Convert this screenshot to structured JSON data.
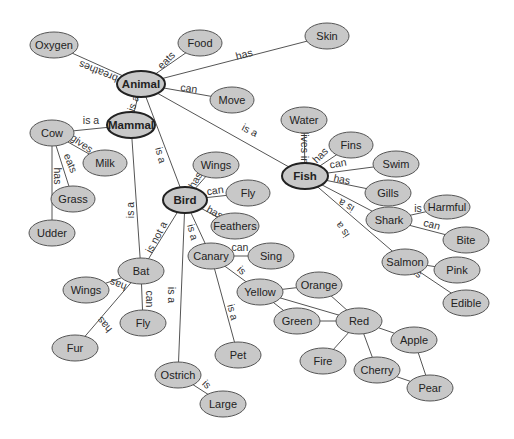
{
  "diagram": {
    "type": "concept-map",
    "colors": {
      "node_fill": "#c8c8c8",
      "node_stroke": "#555555",
      "primary_stroke": "#222222",
      "edge": "#555555",
      "text": "#222222"
    },
    "nodes": [
      {
        "id": "oxygen",
        "label": "Oxygen",
        "x": 54,
        "y": 45,
        "rx": 24,
        "ry": 13
      },
      {
        "id": "food",
        "label": "Food",
        "x": 200,
        "y": 43,
        "rx": 22,
        "ry": 13
      },
      {
        "id": "skin",
        "label": "Skin",
        "x": 327,
        "y": 36,
        "rx": 22,
        "ry": 13
      },
      {
        "id": "animal",
        "label": "Animal",
        "x": 141,
        "y": 84,
        "rx": 24,
        "ry": 13,
        "primary": true
      },
      {
        "id": "move",
        "label": "Move",
        "x": 232,
        "y": 100,
        "rx": 22,
        "ry": 13
      },
      {
        "id": "mammal",
        "label": "Mammal",
        "x": 131,
        "y": 125,
        "rx": 24,
        "ry": 13,
        "primary": true
      },
      {
        "id": "cow",
        "label": "Cow",
        "x": 52,
        "y": 133,
        "rx": 22,
        "ry": 13
      },
      {
        "id": "milk",
        "label": "Milk",
        "x": 105,
        "y": 163,
        "rx": 22,
        "ry": 13
      },
      {
        "id": "grass",
        "label": "Grass",
        "x": 73,
        "y": 199,
        "rx": 22,
        "ry": 13
      },
      {
        "id": "udder",
        "label": "Udder",
        "x": 52,
        "y": 233,
        "rx": 23,
        "ry": 13
      },
      {
        "id": "water",
        "label": "Water",
        "x": 304,
        "y": 120,
        "rx": 23,
        "ry": 13
      },
      {
        "id": "fins",
        "label": "Fins",
        "x": 351,
        "y": 145,
        "rx": 22,
        "ry": 13
      },
      {
        "id": "swim",
        "label": "Swim",
        "x": 396,
        "y": 164,
        "rx": 23,
        "ry": 13
      },
      {
        "id": "fish",
        "label": "Fish",
        "x": 305,
        "y": 176,
        "rx": 23,
        "ry": 13,
        "primary": true
      },
      {
        "id": "gills",
        "label": "Gills",
        "x": 388,
        "y": 193,
        "rx": 23,
        "ry": 13
      },
      {
        "id": "wings_bird",
        "label": "Wings",
        "x": 216,
        "y": 165,
        "rx": 23,
        "ry": 13
      },
      {
        "id": "fly_bird",
        "label": "Fly",
        "x": 248,
        "y": 193,
        "rx": 22,
        "ry": 13
      },
      {
        "id": "bird",
        "label": "Bird",
        "x": 185,
        "y": 200,
        "rx": 22,
        "ry": 13,
        "primary": true
      },
      {
        "id": "feathers",
        "label": "Feathers",
        "x": 235,
        "y": 226,
        "rx": 24,
        "ry": 13
      },
      {
        "id": "harmful",
        "label": "Harmful",
        "x": 447,
        "y": 207,
        "rx": 23,
        "ry": 12
      },
      {
        "id": "shark",
        "label": "Shark",
        "x": 389,
        "y": 220,
        "rx": 23,
        "ry": 13
      },
      {
        "id": "bite",
        "label": "Bite",
        "x": 466,
        "y": 240,
        "rx": 23,
        "ry": 13
      },
      {
        "id": "canary",
        "label": "Canary",
        "x": 211,
        "y": 256,
        "rx": 23,
        "ry": 13
      },
      {
        "id": "sing",
        "label": "Sing",
        "x": 271,
        "y": 256,
        "rx": 23,
        "ry": 13
      },
      {
        "id": "salmon",
        "label": "Salmon",
        "x": 405,
        "y": 262,
        "rx": 23,
        "ry": 13
      },
      {
        "id": "pink",
        "label": "Pink",
        "x": 457,
        "y": 270,
        "rx": 23,
        "ry": 13
      },
      {
        "id": "bat",
        "label": "Bat",
        "x": 141,
        "y": 271,
        "rx": 23,
        "ry": 13
      },
      {
        "id": "wings_bat",
        "label": "Wings",
        "x": 86,
        "y": 290,
        "rx": 23,
        "ry": 13
      },
      {
        "id": "yellow",
        "label": "Yellow",
        "x": 260,
        "y": 292,
        "rx": 23,
        "ry": 13
      },
      {
        "id": "orange",
        "label": "Orange",
        "x": 319,
        "y": 285,
        "rx": 23,
        "ry": 13
      },
      {
        "id": "edible",
        "label": "Edible",
        "x": 466,
        "y": 303,
        "rx": 23,
        "ry": 13
      },
      {
        "id": "fly_bat",
        "label": "Fly",
        "x": 143,
        "y": 323,
        "rx": 23,
        "ry": 13
      },
      {
        "id": "green",
        "label": "Green",
        "x": 297,
        "y": 321,
        "rx": 23,
        "ry": 13
      },
      {
        "id": "red",
        "label": "Red",
        "x": 359,
        "y": 321,
        "rx": 23,
        "ry": 13
      },
      {
        "id": "apple",
        "label": "Apple",
        "x": 414,
        "y": 340,
        "rx": 23,
        "ry": 13
      },
      {
        "id": "fur",
        "label": "Fur",
        "x": 75,
        "y": 348,
        "rx": 23,
        "ry": 13
      },
      {
        "id": "pet",
        "label": "Pet",
        "x": 238,
        "y": 355,
        "rx": 23,
        "ry": 13
      },
      {
        "id": "fire",
        "label": "Fire",
        "x": 323,
        "y": 361,
        "rx": 23,
        "ry": 13
      },
      {
        "id": "cherry",
        "label": "Cherry",
        "x": 377,
        "y": 370,
        "rx": 23,
        "ry": 13
      },
      {
        "id": "ostrich",
        "label": "Ostrich",
        "x": 178,
        "y": 375,
        "rx": 23,
        "ry": 13
      },
      {
        "id": "pear",
        "label": "Pear",
        "x": 430,
        "y": 388,
        "rx": 23,
        "ry": 13
      },
      {
        "id": "large",
        "label": "Large",
        "x": 223,
        "y": 404,
        "rx": 23,
        "ry": 13
      }
    ],
    "edges": [
      {
        "from": "animal",
        "to": "oxygen",
        "label": "breathes",
        "lx": 98,
        "ly": 72,
        "angle": 202
      },
      {
        "from": "animal",
        "to": "food",
        "label": "eats",
        "lx": 166,
        "ly": 60,
        "angle": -45
      },
      {
        "from": "animal",
        "to": "skin",
        "label": "has",
        "lx": 244,
        "ly": 54,
        "angle": -15
      },
      {
        "from": "animal",
        "to": "move",
        "label": "can",
        "lx": 189,
        "ly": 88,
        "angle": 8
      },
      {
        "from": "mammal",
        "to": "animal",
        "label": "is a",
        "lx": 133,
        "ly": 103,
        "angle": -70
      },
      {
        "from": "animal",
        "to": "bird",
        "label": "is a",
        "lx": 161,
        "ly": 155,
        "angle": 75
      },
      {
        "from": "animal",
        "to": "fish",
        "label": "is a",
        "lx": 250,
        "ly": 130,
        "angle": 27
      },
      {
        "from": "cow",
        "to": "mammal",
        "label": "is a",
        "lx": 91,
        "ly": 120,
        "angle": 0
      },
      {
        "from": "cow",
        "to": "milk",
        "label": "gives",
        "lx": 82,
        "ly": 143,
        "angle": 35
      },
      {
        "from": "cow",
        "to": "grass",
        "label": "eats",
        "lx": 71,
        "ly": 163,
        "angle": 68
      },
      {
        "from": "cow",
        "to": "udder",
        "label": "has",
        "lx": 58,
        "ly": 176,
        "angle": 90
      },
      {
        "from": "bat",
        "to": "mammal",
        "label": "is a",
        "lx": 130,
        "ly": 210,
        "angle": -90
      },
      {
        "from": "bird",
        "to": "wings_bird",
        "label": "has",
        "lx": 195,
        "ly": 180,
        "angle": -60
      },
      {
        "from": "bird",
        "to": "fly_bird",
        "label": "can",
        "lx": 215,
        "ly": 190,
        "angle": -8
      },
      {
        "from": "bird",
        "to": "feathers",
        "label": "has",
        "lx": 215,
        "ly": 212,
        "angle": 28
      },
      {
        "from": "bat",
        "to": "bird",
        "label": "is not a",
        "lx": 156,
        "ly": 237,
        "angle": -62
      },
      {
        "from": "canary",
        "to": "bird",
        "label": "is a",
        "lx": 193,
        "ly": 232,
        "angle": 75
      },
      {
        "from": "ostrich",
        "to": "bird",
        "label": "is a",
        "lx": 172,
        "ly": 295,
        "angle": 90
      },
      {
        "from": "fish",
        "to": "water",
        "label": "lives in",
        "lx": 305,
        "ly": 148,
        "angle": 90
      },
      {
        "from": "fish",
        "to": "fins",
        "label": "has",
        "lx": 320,
        "ly": 155,
        "angle": -45
      },
      {
        "from": "fish",
        "to": "swim",
        "label": "can",
        "lx": 338,
        "ly": 163,
        "angle": -10
      },
      {
        "from": "fish",
        "to": "gills",
        "label": "has",
        "lx": 342,
        "ly": 179,
        "angle": 12
      },
      {
        "from": "shark",
        "to": "fish",
        "label": "is a",
        "lx": 346,
        "ly": 206,
        "angle": 210
      },
      {
        "from": "salmon",
        "to": "fish",
        "label": "is a",
        "lx": 342,
        "ly": 230,
        "angle": 235
      },
      {
        "from": "shark",
        "to": "harmful",
        "label": "is",
        "lx": 418,
        "ly": 208,
        "angle": 0
      },
      {
        "from": "shark",
        "to": "bite",
        "label": "can",
        "lx": 432,
        "ly": 224,
        "angle": 15
      },
      {
        "from": "salmon",
        "to": "pink",
        "label": "is",
        "lx": 416,
        "ly": 259,
        "angle": 0
      },
      {
        "from": "salmon",
        "to": "edible",
        "label": "is",
        "lx": 418,
        "ly": 273,
        "angle": 30
      },
      {
        "from": "bat",
        "to": "wings_bat",
        "label": "has",
        "lx": 118,
        "ly": 285,
        "angle": 200
      },
      {
        "from": "bat",
        "to": "fly_bat",
        "label": "can",
        "lx": 150,
        "ly": 299,
        "angle": 90
      },
      {
        "from": "bat",
        "to": "fur",
        "label": "has",
        "lx": 104,
        "ly": 325,
        "angle": -130
      },
      {
        "from": "canary",
        "to": "sing",
        "label": "can",
        "lx": 240,
        "ly": 247,
        "angle": 0
      },
      {
        "from": "canary",
        "to": "yellow",
        "label": "is",
        "lx": 242,
        "ly": 270,
        "angle": 45
      },
      {
        "from": "canary",
        "to": "pet",
        "label": "is a",
        "lx": 233,
        "ly": 312,
        "angle": 75
      },
      {
        "from": "ostrich",
        "to": "large",
        "label": "is",
        "lx": 207,
        "ly": 384,
        "angle": 45
      },
      {
        "from": "yellow",
        "to": "orange",
        "label": ""
      },
      {
        "from": "yellow",
        "to": "green",
        "label": ""
      },
      {
        "from": "yellow",
        "to": "red",
        "label": ""
      },
      {
        "from": "orange",
        "to": "red",
        "label": ""
      },
      {
        "from": "green",
        "to": "red",
        "label": ""
      },
      {
        "from": "red",
        "to": "apple",
        "label": ""
      },
      {
        "from": "red",
        "to": "fire",
        "label": ""
      },
      {
        "from": "red",
        "to": "cherry",
        "label": ""
      },
      {
        "from": "apple",
        "to": "pear",
        "label": ""
      },
      {
        "from": "cherry",
        "to": "pear",
        "label": ""
      }
    ]
  }
}
